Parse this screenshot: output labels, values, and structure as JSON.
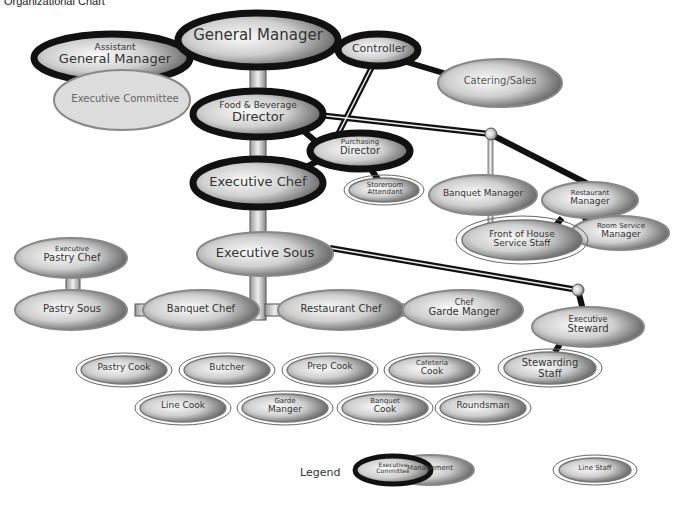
{
  "title": "Organizational Chart",
  "legend": {
    "label": "Legend",
    "items": [
      {
        "type": "exec",
        "l1": "Executive",
        "l2": "Committee"
      },
      {
        "type": "mgmt",
        "l1": "",
        "l2": "Management"
      },
      {
        "type": "line",
        "l1": "",
        "l2": "Line Staff"
      }
    ]
  },
  "nodes": {
    "gm": {
      "l1": "",
      "l2": "General Manager"
    },
    "agm": {
      "l1": "Assistant",
      "l2": "General Manager"
    },
    "exec_committee": {
      "l1": "",
      "l2": "Executive Committee"
    },
    "controller": {
      "l1": "",
      "l2": "Controller"
    },
    "catering": {
      "l1": "",
      "l2": "Catering/Sales"
    },
    "fbd": {
      "l1": "Food & Beverage",
      "l2": "Director"
    },
    "purchasing": {
      "l1": "Purchasing",
      "l2": "Director"
    },
    "storeroom": {
      "l1": "Storeroom",
      "l2": "Attendant"
    },
    "exec_chef": {
      "l1": "",
      "l2": "Executive Chef"
    },
    "banquet_mgr": {
      "l1": "",
      "l2": "Banquet Manager"
    },
    "restaurant_mgr": {
      "l1": "Restaurant",
      "l2": "Manager"
    },
    "room_service": {
      "l1": "Room Service",
      "l2": "Manager"
    },
    "foh": {
      "l1": "Front of House",
      "l2": "Service Staff"
    },
    "exec_sous": {
      "l1": "",
      "l2": "Executive Sous"
    },
    "exec_pastry": {
      "l1": "Executive",
      "l2": "Pastry Chef"
    },
    "pastry_sous": {
      "l1": "",
      "l2": "Pastry Sous"
    },
    "banquet_chef": {
      "l1": "",
      "l2": "Banquet Chef"
    },
    "restaurant_chef": {
      "l1": "",
      "l2": "Restaurant Chef"
    },
    "garde_chef": {
      "l1": "Chef",
      "l2": "Garde Manger"
    },
    "exec_steward": {
      "l1": "Executive",
      "l2": "Steward"
    },
    "stewarding": {
      "l1": "Stewarding",
      "l2": "Staff"
    },
    "pastry_cook": {
      "l1": "",
      "l2": "Pastry Cook"
    },
    "butcher": {
      "l1": "",
      "l2": "Butcher"
    },
    "prep_cook": {
      "l1": "",
      "l2": "Prep Cook"
    },
    "cafeteria_cook": {
      "l1": "Cafeteria",
      "l2": "Cook"
    },
    "line_cook": {
      "l1": "",
      "l2": "Line Cook"
    },
    "garde_manger": {
      "l1": "Garde",
      "l2": "Manger"
    },
    "banquet_cook": {
      "l1": "Banquet",
      "l2": "Cook"
    },
    "roundsman": {
      "l1": "",
      "l2": "Roundsman"
    }
  }
}
